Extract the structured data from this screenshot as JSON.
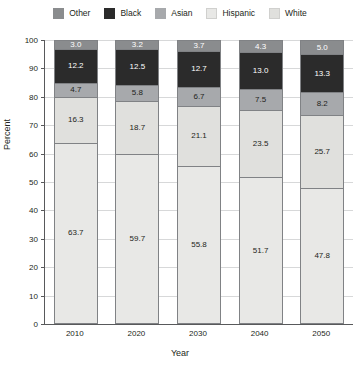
{
  "chart_data": {
    "type": "bar",
    "subtype": "stacked-bar-100-percent",
    "title": "",
    "xlabel": "Year",
    "ylabel": "Percent",
    "categories": [
      "2010",
      "2020",
      "2030",
      "2040",
      "2050"
    ],
    "ylim": [
      0,
      100
    ],
    "yticks": [
      0,
      10,
      20,
      30,
      40,
      50,
      60,
      70,
      80,
      90,
      100
    ],
    "ytick_labels": [
      "0",
      "10",
      "20",
      "30",
      "40",
      "50",
      "60",
      "70",
      "80",
      "90",
      "100"
    ],
    "grid": true,
    "legend_position": "top",
    "stack_order_bottom_to_top": [
      "White",
      "Hispanic",
      "Asian",
      "Black",
      "Other"
    ],
    "series": [
      {
        "name": "White",
        "color": "#e8e8e6",
        "label_color": "#231f20",
        "values": [
          63.7,
          59.7,
          55.8,
          51.7,
          47.8
        ]
      },
      {
        "name": "Hispanic",
        "color": "#e0e0dd",
        "label_color": "#231f20",
        "values": [
          16.3,
          18.7,
          21.1,
          23.5,
          25.7
        ]
      },
      {
        "name": "Asian",
        "color": "#a7a9ac",
        "label_color": "#231f20",
        "values": [
          4.7,
          5.8,
          6.7,
          7.5,
          8.2
        ]
      },
      {
        "name": "Black",
        "color": "#2b2b2b",
        "label_color": "#ffffff",
        "values": [
          12.2,
          12.5,
          12.7,
          13.0,
          13.3
        ]
      },
      {
        "name": "Other",
        "color": "#8a8c8e",
        "label_color": "#ffffff",
        "values": [
          3.0,
          3.2,
          3.7,
          4.3,
          5.0
        ]
      }
    ]
  },
  "legend": {
    "items": [
      {
        "label": "Other",
        "color": "#8a8c8e"
      },
      {
        "label": "Black",
        "color": "#2b2b2b"
      },
      {
        "label": "Asian",
        "color": "#a7a9ac"
      },
      {
        "label": "Hispanic",
        "color": "#e8e8e6"
      },
      {
        "label": "White",
        "color": "#e0e0dd"
      }
    ]
  },
  "axes": {
    "x_title": "Year",
    "y_title": "Percent"
  },
  "colors": {
    "axis": "#58595b",
    "grid": "#d7d8d9",
    "bar_border": "#808285",
    "text": "#231f20",
    "background": "#ffffff"
  }
}
